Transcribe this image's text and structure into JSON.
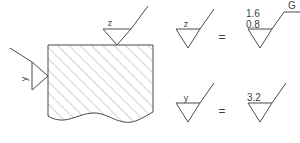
{
  "drawing": {
    "title": "Surface roughness symbol equivalence diagram",
    "stroke_color": "#4a4a4a",
    "hatch_color": "#7d7d7d",
    "text_color": "#3f3f3f",
    "background": "#ffffff"
  },
  "workpiece": {
    "name": "hatched section view",
    "hatch_angle_label": "45",
    "break_line": "wavy"
  },
  "callouts": {
    "top": {
      "label": "z",
      "target": "top surface"
    },
    "left": {
      "label": "y",
      "target": "left surface"
    }
  },
  "equations": [
    {
      "id": "eq-z",
      "left_symbol_label": "z",
      "operator": "=",
      "right_upper_value": "1.6",
      "right_lower_value": "0.8",
      "process_label": "G"
    },
    {
      "id": "eq-y",
      "left_symbol_label": "y",
      "operator": "=",
      "right_upper_value": "3.2",
      "right_lower_value": "",
      "process_label": ""
    }
  ]
}
